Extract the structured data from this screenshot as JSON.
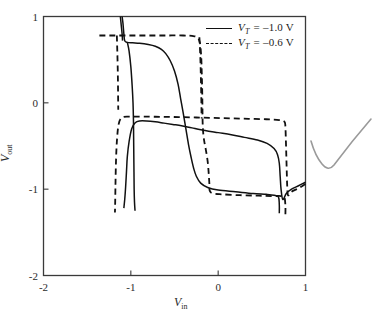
{
  "chart_data": {
    "type": "line",
    "title": "",
    "subtitle": "",
    "xlabel": "V_in",
    "ylabel": "V_out",
    "xlabel_main": "V",
    "xlabel_sub": "in",
    "ylabel_main": "V",
    "ylabel_sub": "out",
    "xlim": [
      -2,
      1
    ],
    "ylim": [
      -2,
      1
    ],
    "xticks": [
      -2,
      -1,
      0,
      1
    ],
    "yticks": [
      -2,
      -1,
      0,
      1
    ],
    "xticklabels": [
      "-2",
      "-1",
      "0",
      "1"
    ],
    "yticklabels": [
      "-2",
      "-1",
      "0",
      "1"
    ],
    "grid": false,
    "legend_position": "top-right",
    "frame": "box",
    "annotations": [
      {
        "name": "scan-artifact-checkmark",
        "color": "#9a9a9a",
        "description": "gray check-mark stroke outside right edge of plot frame"
      }
    ],
    "series": [
      {
        "name": "V_T = -1.0 V",
        "label_main": "V",
        "label_sub": "T",
        "label_eq": "=",
        "label_value": "–1.0 V",
        "style": "solid",
        "color": "#111111",
        "branches": [
          {
            "name": "forward-sweep",
            "direction": "increasing Vin",
            "points": [
              [
                -1.1,
                1.0
              ],
              [
                -1.09,
                0.92
              ],
              [
                -1.08,
                0.8
              ],
              [
                -1.07,
                0.72
              ],
              [
                -1.04,
                0.7
              ],
              [
                -0.98,
                0.695
              ],
              [
                -0.9,
                0.69
              ],
              [
                -0.8,
                0.675
              ],
              [
                -0.72,
                0.655
              ],
              [
                -0.65,
                0.62
              ],
              [
                -0.6,
                0.57
              ],
              [
                -0.55,
                0.49
              ],
              [
                -0.5,
                0.37
              ],
              [
                -0.46,
                0.22
              ],
              [
                -0.43,
                0.05
              ],
              [
                -0.4,
                -0.12
              ],
              [
                -0.37,
                -0.3
              ],
              [
                -0.34,
                -0.48
              ],
              [
                -0.31,
                -0.63
              ],
              [
                -0.28,
                -0.76
              ],
              [
                -0.25,
                -0.85
              ],
              [
                -0.2,
                -0.93
              ],
              [
                -0.12,
                -0.98
              ],
              [
                0.0,
                -1.01
              ],
              [
                0.2,
                -1.03
              ],
              [
                0.4,
                -1.05
              ],
              [
                0.55,
                -1.06
              ],
              [
                0.64,
                -1.07
              ],
              [
                0.69,
                -1.09
              ],
              [
                0.7,
                -1.18
              ],
              [
                0.7,
                -1.28
              ]
            ]
          },
          {
            "name": "reverse-sweep",
            "direction": "decreasing Vin",
            "points": [
              [
                1.0,
                -0.92
              ],
              [
                0.92,
                -0.96
              ],
              [
                0.84,
                -1.0
              ],
              [
                0.78,
                -1.05
              ],
              [
                0.74,
                -1.12
              ],
              [
                0.72,
                -1.0
              ],
              [
                0.71,
                -0.85
              ],
              [
                0.7,
                -0.7
              ],
              [
                0.68,
                -0.6
              ],
              [
                0.64,
                -0.53
              ],
              [
                0.56,
                -0.47
              ],
              [
                0.45,
                -0.43
              ],
              [
                0.3,
                -0.4
              ],
              [
                0.15,
                -0.37
              ],
              [
                0.0,
                -0.345
              ],
              [
                -0.15,
                -0.32
              ],
              [
                -0.3,
                -0.29
              ],
              [
                -0.42,
                -0.265
              ],
              [
                -0.52,
                -0.25
              ],
              [
                -0.62,
                -0.235
              ],
              [
                -0.72,
                -0.22
              ],
              [
                -0.82,
                -0.21
              ],
              [
                -0.9,
                -0.21
              ],
              [
                -0.95,
                -0.23
              ],
              [
                -0.99,
                -0.3
              ],
              [
                -1.02,
                -0.45
              ],
              [
                -1.04,
                -0.62
              ],
              [
                -1.05,
                -0.8
              ],
              [
                -1.06,
                -0.98
              ],
              [
                -1.07,
                -1.12
              ],
              [
                -1.08,
                -1.22
              ]
            ]
          },
          {
            "name": "upper-rail-entry",
            "direction": "upper branch rising to rail",
            "points": [
              [
                -1.04,
                0.7
              ],
              [
                -1.02,
                0.6
              ],
              [
                -1.0,
                0.42
              ],
              [
                -0.985,
                0.2
              ],
              [
                -0.975,
                0.0
              ],
              [
                -0.97,
                -0.2
              ],
              [
                -0.968,
                -0.4
              ],
              [
                -0.966,
                -0.6
              ],
              [
                -0.964,
                -0.8
              ],
              [
                -0.962,
                -1.0
              ],
              [
                -0.958,
                -1.15
              ],
              [
                -0.952,
                -1.25
              ]
            ]
          },
          {
            "name": "rail-upper-left-vertical",
            "direction": "vertical segment at left of loop",
            "points": [
              [
                -1.12,
                1.0
              ],
              [
                -1.11,
                0.9
              ],
              [
                -1.1,
                0.8
              ],
              [
                -1.095,
                0.72
              ]
            ]
          }
        ]
      },
      {
        "name": "V_T = -0.6 V",
        "label_main": "V",
        "label_sub": "T",
        "label_eq": "=",
        "label_value": "–0.6 V",
        "style": "dashed",
        "color": "#111111",
        "branches": [
          {
            "name": "forward-sweep",
            "direction": "increasing Vin",
            "points": [
              [
                -1.36,
                0.78
              ],
              [
                -1.2,
                0.78
              ],
              [
                -1.0,
                0.78
              ],
              [
                -0.8,
                0.78
              ],
              [
                -0.6,
                0.78
              ],
              [
                -0.4,
                0.78
              ],
              [
                -0.3,
                0.775
              ],
              [
                -0.24,
                0.76
              ],
              [
                -0.21,
                0.7
              ],
              [
                -0.195,
                0.55
              ],
              [
                -0.188,
                0.35
              ],
              [
                -0.183,
                0.15
              ],
              [
                -0.18,
                -0.05
              ],
              [
                -0.178,
                -0.22
              ],
              [
                -0.172,
                -0.34
              ],
              [
                -0.16,
                -0.44
              ],
              [
                -0.14,
                -0.55
              ],
              [
                -0.12,
                -0.68
              ],
              [
                -0.108,
                -0.82
              ],
              [
                -0.1,
                -0.95
              ],
              [
                -0.096,
                -1.02
              ],
              [
                -0.06,
                -1.05
              ],
              [
                0.05,
                -1.06
              ],
              [
                0.25,
                -1.07
              ],
              [
                0.45,
                -1.075
              ],
              [
                0.62,
                -1.08
              ],
              [
                0.72,
                -1.08
              ],
              [
                0.76,
                -1.1
              ],
              [
                0.77,
                -1.2
              ],
              [
                0.77,
                -1.29
              ]
            ]
          },
          {
            "name": "reverse-sweep",
            "direction": "decreasing Vin",
            "points": [
              [
                1.0,
                -0.94
              ],
              [
                0.92,
                -0.99
              ],
              [
                0.84,
                -1.03
              ],
              [
                0.8,
                -1.07
              ],
              [
                0.79,
                -0.95
              ],
              [
                0.785,
                -0.78
              ],
              [
                0.78,
                -0.6
              ],
              [
                0.775,
                -0.42
              ],
              [
                0.77,
                -0.28
              ],
              [
                0.76,
                -0.22
              ],
              [
                0.7,
                -0.2
              ],
              [
                0.55,
                -0.19
              ],
              [
                0.35,
                -0.185
              ],
              [
                0.15,
                -0.18
              ],
              [
                -0.05,
                -0.175
              ],
              [
                -0.25,
                -0.17
              ],
              [
                -0.45,
                -0.165
              ],
              [
                -0.65,
                -0.162
              ],
              [
                -0.85,
                -0.16
              ],
              [
                -1.0,
                -0.16
              ],
              [
                -1.1,
                -0.17
              ],
              [
                -1.14,
                -0.25
              ],
              [
                -1.16,
                -0.45
              ],
              [
                -1.17,
                -0.68
              ],
              [
                -1.175,
                -0.9
              ],
              [
                -1.178,
                -1.08
              ],
              [
                -1.18,
                -1.2
              ],
              [
                -1.182,
                -1.27
              ]
            ]
          },
          {
            "name": "upper-rail-entry",
            "direction": "left vertical rise of dashed loop",
            "points": [
              [
                -1.16,
                0.78
              ],
              [
                -1.155,
                0.6
              ],
              [
                -1.15,
                0.4
              ],
              [
                -1.147,
                0.2
              ],
              [
                -1.145,
                0.0
              ],
              [
                -1.144,
                -0.08
              ]
            ]
          },
          {
            "name": "dashed-upper-right-drop",
            "direction": "right vertical fall of dashed loop",
            "points": [
              [
                -0.215,
                0.76
              ],
              [
                -0.205,
                0.55
              ],
              [
                -0.198,
                0.3
              ],
              [
                -0.193,
                0.05
              ],
              [
                -0.19,
                -0.15
              ],
              [
                -0.188,
                -0.18
              ]
            ]
          }
        ]
      }
    ]
  }
}
